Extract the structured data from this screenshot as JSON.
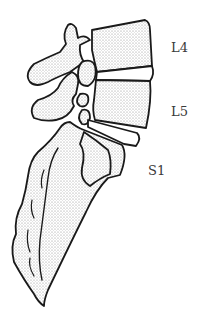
{
  "diagram": {
    "labels": [
      {
        "id": "l4",
        "text": "L4",
        "x": 171,
        "y": 40
      },
      {
        "id": "l5",
        "text": "L5",
        "x": 171,
        "y": 104
      },
      {
        "id": "s1",
        "text": "S1",
        "x": 148,
        "y": 163
      }
    ],
    "colors": {
      "outline": "#1a1a1a",
      "stipple": "#9a9a9a",
      "background": "#ffffff"
    }
  }
}
